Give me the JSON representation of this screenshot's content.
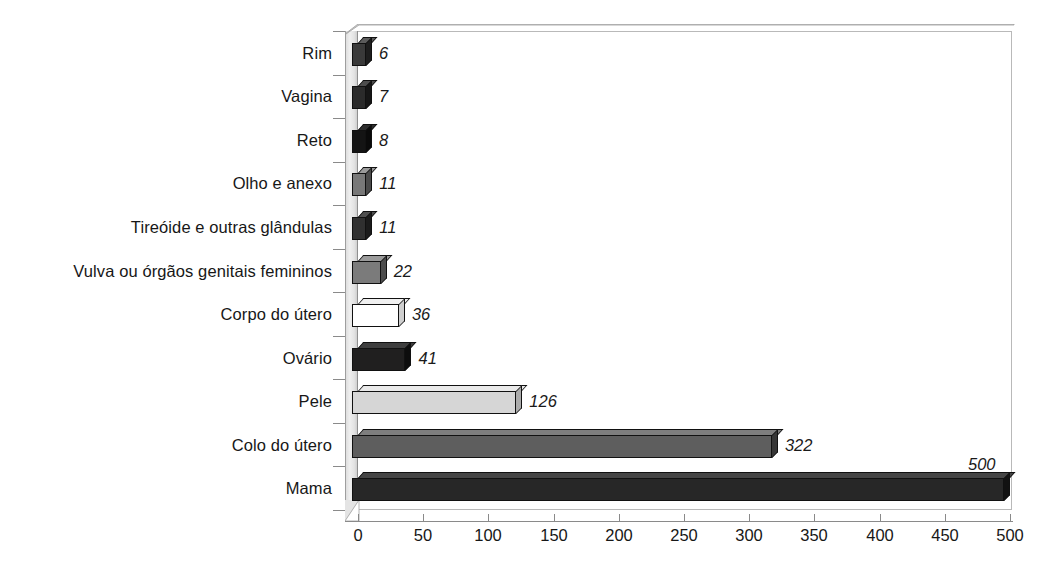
{
  "chart_data": {
    "type": "bar",
    "orientation": "horizontal",
    "title": "",
    "subtitle": "",
    "xlabel": "",
    "ylabel": "",
    "xlim": [
      0,
      500
    ],
    "grid": false,
    "legend": null,
    "legend_position": "none",
    "style": "3d-bar",
    "xticks": [
      0,
      50,
      100,
      150,
      200,
      250,
      300,
      350,
      400,
      450,
      500
    ],
    "xtick_labels": [
      "0",
      "50",
      "100",
      "150",
      "200",
      "250",
      "300",
      "350",
      "400",
      "450",
      "500"
    ],
    "categories": [
      "Rim",
      "Vagina",
      "Reto",
      "Olho e anexo",
      "Tireóide e outras glândulas",
      "Vulva ou órgãos genitais femininos",
      "Corpo do útero",
      "Ovário",
      "Pele",
      "Colo do útero",
      "Mama"
    ],
    "values": [
      6,
      7,
      8,
      11,
      11,
      22,
      36,
      41,
      126,
      322,
      500
    ],
    "value_labels": [
      "6",
      "7",
      "8",
      "11",
      "11",
      "22",
      "36",
      "41",
      "126",
      "322",
      "500"
    ],
    "bar_colors": [
      "#3a3a3a",
      "#2b2b2b",
      "#141414",
      "#787878",
      "#303030",
      "#7b7b7b",
      "#ffffff",
      "#201f1f",
      "#d6d6d6",
      "#5e5e5e",
      "#272727"
    ],
    "bar_top_colors": [
      "#5c5c5c",
      "#4d4d4d",
      "#2e2e2e",
      "#9a9a9a",
      "#4f4f4f",
      "#9b9b9b",
      "#f0f0f0",
      "#3e3e3e",
      "#e9e9e9",
      "#7e7e7e",
      "#454545"
    ],
    "bar_side_colors": [
      "#1e1e1e",
      "#161616",
      "#0a0a0a",
      "#4a4a4a",
      "#1b1b1b",
      "#4c4c4c",
      "#cfcfcf",
      "#0d0d0d",
      "#ababab",
      "#363636",
      "#121212"
    ]
  },
  "axis": {
    "wall_color": "#e8e8e8",
    "line_color": "#8a8a8a",
    "frame_color": "#b9b9b9"
  },
  "text": {
    "label_color": "#171717",
    "value_color": "#1a1a1a"
  }
}
